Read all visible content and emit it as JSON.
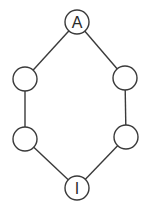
{
  "diagram": {
    "type": "graph",
    "colors": {
      "stroke": "#3a3a3a",
      "fill": "#ffffff",
      "text": "#2a2a2a"
    },
    "nodes": [
      {
        "id": "top",
        "label": "A",
        "x": 77,
        "y": 22,
        "r": 12
      },
      {
        "id": "left-upper",
        "label": "",
        "x": 25,
        "y": 79,
        "r": 12
      },
      {
        "id": "right-upper",
        "label": "",
        "x": 125,
        "y": 78,
        "r": 12
      },
      {
        "id": "left-lower",
        "label": "",
        "x": 25,
        "y": 139,
        "r": 12
      },
      {
        "id": "right-lower",
        "label": "",
        "x": 126,
        "y": 137,
        "r": 12
      },
      {
        "id": "bottom",
        "label": "I",
        "x": 77,
        "y": 188,
        "r": 12
      }
    ],
    "edges": [
      {
        "from": "top",
        "to": "left-upper"
      },
      {
        "from": "top",
        "to": "right-upper"
      },
      {
        "from": "left-upper",
        "to": "left-lower"
      },
      {
        "from": "right-upper",
        "to": "right-lower"
      },
      {
        "from": "left-lower",
        "to": "bottom"
      },
      {
        "from": "right-lower",
        "to": "bottom"
      }
    ]
  }
}
